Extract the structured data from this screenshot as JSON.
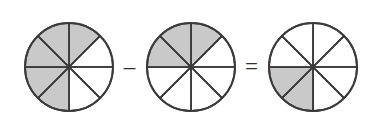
{
  "figure": {
    "background_color": "#ffffff",
    "shaded_color": "#c9c9c9",
    "unshaded_color": "#ffffff",
    "line_color": "#3b3b3b",
    "sectors_per_circle": 8
  },
  "operators": {
    "minus": "–",
    "equals": "="
  },
  "circles": [
    {
      "name": "minuend",
      "label": "5/8",
      "numerator": 5,
      "denominator": 8,
      "shaded_sectors": [
        0,
        5,
        6,
        7,
        4
      ],
      "shaded_count": 5
    },
    {
      "name": "subtrahend",
      "label": "3/8",
      "numerator": 3,
      "denominator": 8,
      "shaded_sectors": [
        0,
        6,
        7
      ],
      "shaded_count": 3
    },
    {
      "name": "difference",
      "label": "2/8",
      "numerator": 2,
      "denominator": 8,
      "shaded_sectors": [
        4,
        5
      ],
      "shaded_count": 2
    }
  ]
}
